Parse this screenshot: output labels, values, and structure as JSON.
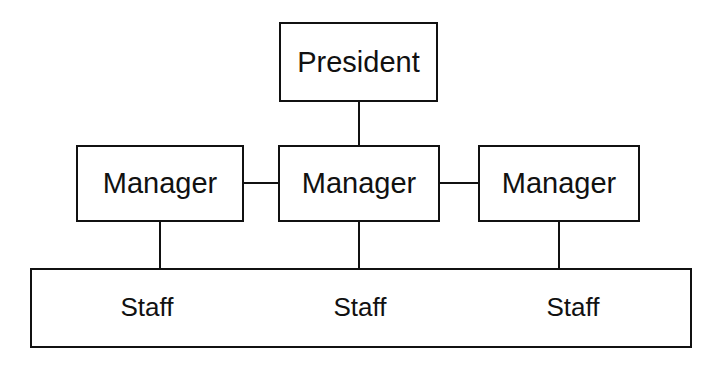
{
  "diagram": {
    "type": "org-chart",
    "colors": {
      "background": "#ffffff",
      "line": "#111111",
      "text": "#111111",
      "box_fill": "#ffffff"
    },
    "nodes": {
      "president": {
        "label": "President",
        "x": 279,
        "y": 22,
        "width": 159,
        "height": 80
      },
      "manager_left": {
        "label": "Manager",
        "x": 76,
        "y": 145,
        "width": 168,
        "height": 77
      },
      "manager_center": {
        "label": "Manager",
        "x": 278,
        "y": 145,
        "width": 162,
        "height": 77
      },
      "manager_right": {
        "label": "Manager",
        "x": 478,
        "y": 145,
        "width": 162,
        "height": 77
      }
    },
    "staff_bar": {
      "x": 30,
      "y": 268,
      "width": 662,
      "height": 80,
      "labels": [
        {
          "text": "Staff",
          "cx": 147,
          "cy": 307
        },
        {
          "text": "Staff",
          "cx": 360,
          "cy": 307
        },
        {
          "text": "Staff",
          "cx": 573,
          "cy": 307
        }
      ]
    },
    "connectors": {
      "president_to_center_manager": {
        "x": 358,
        "y": 102,
        "length": 43
      },
      "left_to_center_manager": {
        "x": 244,
        "y": 182,
        "length": 34
      },
      "center_to_right_manager": {
        "x": 440,
        "y": 182,
        "length": 38
      },
      "left_manager_to_staff": {
        "x": 159,
        "y": 222,
        "length": 46
      },
      "center_manager_to_staff": {
        "x": 358,
        "y": 222,
        "length": 46
      },
      "right_manager_to_staff": {
        "x": 558,
        "y": 222,
        "length": 46
      }
    }
  }
}
